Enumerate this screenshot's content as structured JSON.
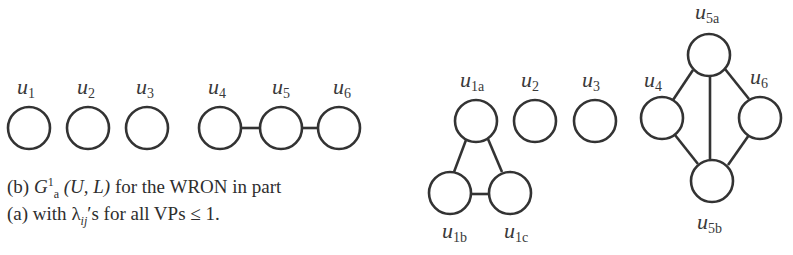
{
  "figure_b": {
    "nodes": [
      {
        "id": "u1",
        "label": "u",
        "sub": "1",
        "cx": 29,
        "cy": 128
      },
      {
        "id": "u2",
        "label": "u",
        "sub": "2",
        "cx": 88,
        "cy": 128
      },
      {
        "id": "u3",
        "label": "u",
        "sub": "3",
        "cx": 147,
        "cy": 128
      },
      {
        "id": "u4",
        "label": "u",
        "sub": "4",
        "cx": 220,
        "cy": 128
      },
      {
        "id": "u5",
        "label": "u",
        "sub": "5",
        "cx": 281,
        "cy": 128
      },
      {
        "id": "u6",
        "label": "u",
        "sub": "6",
        "cx": 339,
        "cy": 128
      }
    ],
    "edges": [
      [
        "u4",
        "u5"
      ],
      [
        "u5",
        "u6"
      ]
    ],
    "caption": {
      "line1_prefix": "(b) ",
      "G": "G",
      "G_sup": "1",
      "G_sub": "a",
      "line1_args": " (U, L)",
      "line1_suffix": " for the WRON in part",
      "line2_prefix": "(a) with ",
      "lambda": "λ",
      "lambda_sub": "ij",
      "line2_suffix": "′s for all VPs ≤ 1."
    }
  },
  "figure_c": {
    "nodes": [
      {
        "id": "u1a",
        "label": "u",
        "sub": "1a",
        "cx": 476,
        "cy": 121
      },
      {
        "id": "u2",
        "label": "u",
        "sub": "2",
        "cx": 535,
        "cy": 121
      },
      {
        "id": "u3",
        "label": "u",
        "sub": "3",
        "cx": 595,
        "cy": 121
      },
      {
        "id": "u1b",
        "label": "u",
        "sub": "1b",
        "cx": 450,
        "cy": 192
      },
      {
        "id": "u1c",
        "label": "u",
        "sub": "1c",
        "cx": 510,
        "cy": 192
      },
      {
        "id": "u4",
        "label": "u",
        "sub": "4",
        "cx": 662,
        "cy": 118
      },
      {
        "id": "u5a",
        "label": "u",
        "sub": "5a",
        "cx": 709,
        "cy": 55
      },
      {
        "id": "u6",
        "label": "u",
        "sub": "6",
        "cx": 760,
        "cy": 118
      },
      {
        "id": "u5b",
        "label": "u",
        "sub": "5b",
        "cx": 712,
        "cy": 181
      }
    ],
    "edges": [
      [
        "u1a",
        "u1b"
      ],
      [
        "u1a",
        "u1c"
      ],
      [
        "u1b",
        "u1c"
      ],
      [
        "u5a",
        "u4"
      ],
      [
        "u5a",
        "u6"
      ],
      [
        "u5a",
        "u5b"
      ],
      [
        "u4",
        "u5b"
      ],
      [
        "u6",
        "u5b"
      ]
    ]
  }
}
